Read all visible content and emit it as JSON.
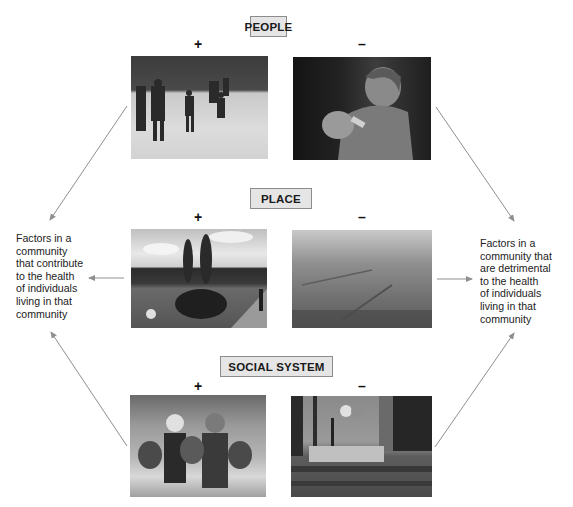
{
  "categories": [
    {
      "label": "PEOPLE",
      "positive": {
        "sign": "+",
        "image": "children-ice-skating-photo"
      },
      "negative": {
        "sign": "–",
        "image": "mother-bottle-feeding-baby-photo"
      }
    },
    {
      "label": "PLACE",
      "positive": {
        "sign": "+",
        "image": "green-park-with-trees-photo"
      },
      "negative": {
        "sign": "–",
        "image": "smog-polluted-city-photo"
      }
    },
    {
      "label": "SOCIAL SYSTEM",
      "positive": {
        "sign": "+",
        "image": "children-at-playground-photo"
      },
      "negative": {
        "sign": "–",
        "image": "empty-urban-plaza-photo"
      }
    }
  ],
  "left_text": {
    "lines": [
      "Factors in a",
      "community",
      "that contribute",
      "to the health",
      "of individuals",
      "living in that",
      "community"
    ]
  },
  "right_text": {
    "lines": [
      "Factors in a",
      "community that",
      "are detrimental",
      "to the health",
      "of individuals",
      "living in that",
      "community"
    ]
  },
  "colors": {
    "label_fill": "#e5e5e5",
    "label_border": "#8c8c8c",
    "arrow": "#8f8f8f"
  }
}
